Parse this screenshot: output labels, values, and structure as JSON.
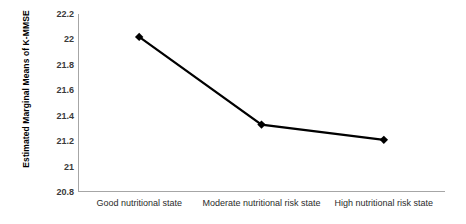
{
  "chart_data": {
    "type": "line",
    "title": "",
    "xlabel": "",
    "ylabel": "Estimated Marginal Means of K-MMSE",
    "categories": [
      "Good nutritional state",
      "Moderate nutritional risk state",
      "High nutritional risk state"
    ],
    "values": [
      22.02,
      21.33,
      21.21
    ],
    "series": [
      {
        "name": "Estimated Marginal Means of K-MMSE",
        "values": [
          22.02,
          21.33,
          21.21
        ]
      }
    ],
    "ylim": [
      20.8,
      22.2
    ],
    "ytick_values": [
      22.2,
      22.0,
      21.8,
      21.6,
      21.4,
      21.2,
      21.0,
      20.8
    ],
    "ytick_labels": [
      "22.2",
      "22",
      "21.8",
      "21.6",
      "21.4",
      "21.2",
      "21",
      "20.8"
    ],
    "ytick_step": 0.2,
    "grid": false,
    "legend": "none",
    "marker": "diamond",
    "line_color": "#000000",
    "marker_color": "#000000",
    "axis_color": "#a6a6a6",
    "background_color": "#ffffff"
  }
}
